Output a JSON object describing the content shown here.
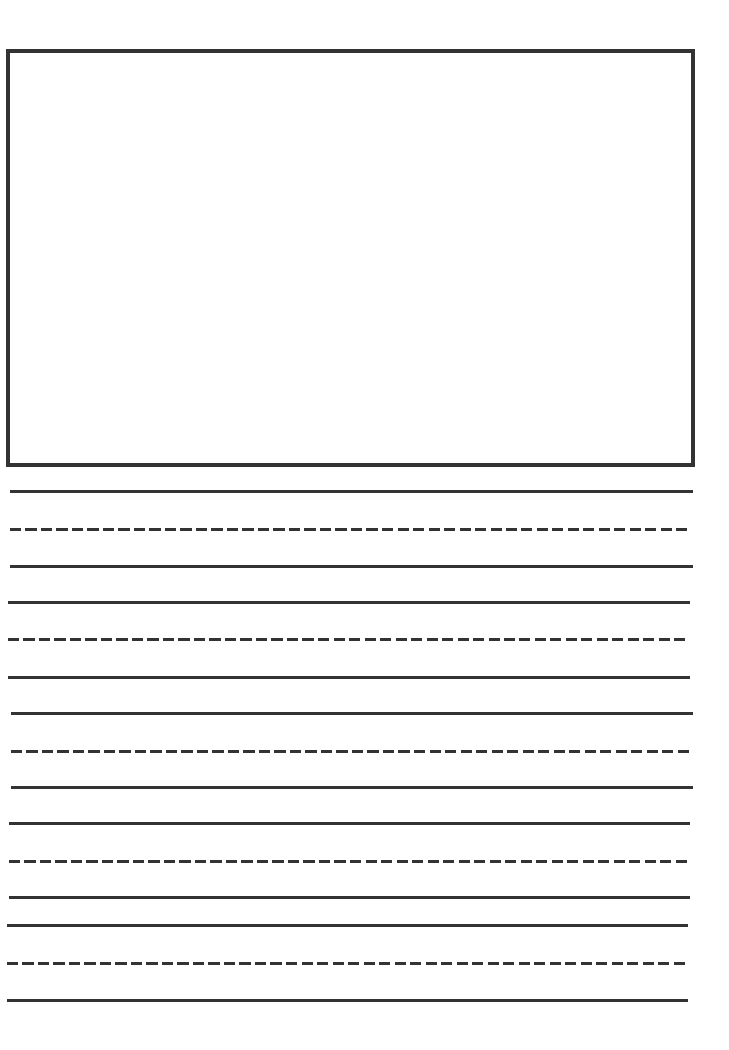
{
  "page": {
    "type": "primary writing paper",
    "background": "#ffffff",
    "ink_color": "#333333"
  },
  "drawing_box": {
    "label": "",
    "left": 6,
    "top": 49,
    "right": 693,
    "bottom": 467
  },
  "writing_lines": [
    {
      "group": 1,
      "lines": [
        {
          "kind": "solid",
          "y": 490,
          "x1": 10,
          "x2": 693
        },
        {
          "kind": "dashed",
          "y": 528,
          "x1": 10,
          "x2": 690
        },
        {
          "kind": "solid",
          "y": 565,
          "x1": 10,
          "x2": 693
        }
      ]
    },
    {
      "group": 2,
      "lines": [
        {
          "kind": "solid",
          "y": 601,
          "x1": 8,
          "x2": 690
        },
        {
          "kind": "dashed",
          "y": 638,
          "x1": 8,
          "x2": 687
        },
        {
          "kind": "solid",
          "y": 676,
          "x1": 8,
          "x2": 690
        }
      ]
    },
    {
      "group": 3,
      "lines": [
        {
          "kind": "solid",
          "y": 712,
          "x1": 11,
          "x2": 693
        },
        {
          "kind": "dashed",
          "y": 750,
          "x1": 11,
          "x2": 690
        },
        {
          "kind": "solid",
          "y": 786,
          "x1": 11,
          "x2": 693
        }
      ]
    },
    {
      "group": 4,
      "lines": [
        {
          "kind": "solid",
          "y": 822,
          "x1": 9,
          "x2": 690
        },
        {
          "kind": "dashed",
          "y": 860,
          "x1": 9,
          "x2": 687
        },
        {
          "kind": "solid",
          "y": 896,
          "x1": 9,
          "x2": 690
        }
      ]
    },
    {
      "group": 5,
      "lines": [
        {
          "kind": "solid",
          "y": 924,
          "x1": 7,
          "x2": 688
        },
        {
          "kind": "dashed",
          "y": 962,
          "x1": 7,
          "x2": 685
        },
        {
          "kind": "solid",
          "y": 999,
          "x1": 7,
          "x2": 688
        }
      ]
    }
  ]
}
